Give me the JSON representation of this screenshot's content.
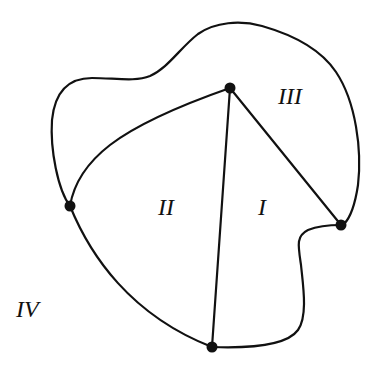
{
  "diagram": {
    "type": "planar-graph",
    "vertices": [
      {
        "id": "top",
        "name": "top-vertex"
      },
      {
        "id": "left",
        "name": "left-vertex"
      },
      {
        "id": "right",
        "name": "right-vertex"
      },
      {
        "id": "bottom",
        "name": "bottom-vertex"
      }
    ],
    "edges": [
      {
        "id": "top-left",
        "from": "top",
        "to": "left",
        "kind": "curve"
      },
      {
        "id": "top-bottom",
        "from": "top",
        "to": "bottom",
        "kind": "straight"
      },
      {
        "id": "top-right",
        "from": "top",
        "to": "right",
        "kind": "straight"
      },
      {
        "id": "left-bottom",
        "from": "left",
        "to": "bottom",
        "kind": "curve"
      },
      {
        "id": "bottom-right",
        "from": "bottom",
        "to": "right",
        "kind": "curve"
      },
      {
        "id": "left-right-outer",
        "from": "left",
        "to": "right",
        "kind": "outer-loop-curve"
      }
    ],
    "regions": [
      {
        "id": "I",
        "label": "I"
      },
      {
        "id": "II",
        "label": "II"
      },
      {
        "id": "III",
        "label": "III"
      },
      {
        "id": "IV",
        "label": "IV"
      }
    ],
    "colors": {
      "stroke": "#111111",
      "background": "#ffffff"
    }
  }
}
